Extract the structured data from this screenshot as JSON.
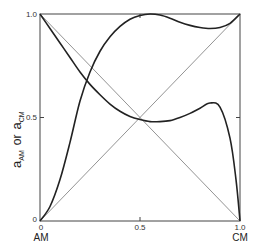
{
  "chart_data": {
    "type": "line",
    "title": "",
    "xlabel": "",
    "ylabel": "a_AM or a_CM",
    "xlim": [
      0,
      1
    ],
    "ylim": [
      0,
      1
    ],
    "grid": false,
    "legend": null,
    "x_ticks": [
      {
        "value": 0,
        "label": "0"
      },
      {
        "value": 0.5,
        "label": "0.5"
      },
      {
        "value": 1.0,
        "label": "1.0"
      }
    ],
    "y_ticks": [
      {
        "value": 0,
        "label": "0"
      },
      {
        "value": 0.5,
        "label": "0.5"
      },
      {
        "value": 1.0,
        "label": "1.0"
      }
    ],
    "x_end_labels": {
      "left": "AM",
      "right": "CM"
    },
    "series": [
      {
        "name": "a_AM",
        "style": "thick",
        "x": [
          0,
          0.05,
          0.1,
          0.15,
          0.2,
          0.25,
          0.3,
          0.35,
          0.4,
          0.45,
          0.5,
          0.55,
          0.6,
          0.65,
          0.7,
          0.75,
          0.8,
          0.85,
          0.9,
          0.95,
          1.0
        ],
        "y": [
          0,
          0.07,
          0.2,
          0.38,
          0.58,
          0.72,
          0.82,
          0.89,
          0.94,
          0.975,
          0.993,
          1.0,
          0.995,
          0.98,
          0.96,
          0.945,
          0.935,
          0.93,
          0.935,
          0.955,
          1.0
        ]
      },
      {
        "name": "a_CM",
        "style": "thick",
        "x": [
          0,
          0.05,
          0.1,
          0.15,
          0.2,
          0.25,
          0.3,
          0.35,
          0.4,
          0.45,
          0.5,
          0.55,
          0.6,
          0.65,
          0.7,
          0.75,
          0.8,
          0.85,
          0.9,
          0.95,
          0.98,
          1.0
        ],
        "y": [
          1.0,
          0.93,
          0.86,
          0.79,
          0.72,
          0.66,
          0.61,
          0.565,
          0.53,
          0.505,
          0.49,
          0.48,
          0.48,
          0.485,
          0.5,
          0.52,
          0.545,
          0.57,
          0.55,
          0.4,
          0.2,
          0
        ]
      },
      {
        "name": "diagonal-rising",
        "style": "thin",
        "x": [
          0,
          1
        ],
        "y": [
          0,
          1
        ]
      },
      {
        "name": "diagonal-falling",
        "style": "thin",
        "x": [
          0,
          1
        ],
        "y": [
          1,
          0
        ]
      }
    ]
  },
  "labels": {
    "y_axis_main": "a",
    "y_axis_sub1": "AM",
    "y_axis_or": "or",
    "y_axis_main2": "a",
    "y_axis_sub2": "CM",
    "x_left": "AM",
    "x_right": "CM",
    "x_tick_0": "0",
    "x_tick_05": "0.5",
    "x_tick_1": "1.0",
    "y_tick_0": "0",
    "y_tick_05": "0.5",
    "y_tick_1": "1.0"
  },
  "colors": {
    "curve": "#222222",
    "diagonal": "#777777",
    "frame": "#444444"
  }
}
